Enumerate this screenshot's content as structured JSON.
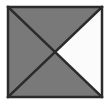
{
  "figure": {
    "name": "square-with-diagonals",
    "canvas": {
      "width": 110,
      "height": 104,
      "background_color": "#ffffff"
    },
    "square": {
      "left": 8,
      "top": 7,
      "right": 102,
      "bottom": 97,
      "stroke_color": "#2b2b2b",
      "stroke_width": 2.5
    },
    "center": {
      "x": 55,
      "y": 52
    },
    "colors": {
      "gray_fill": "#797979",
      "white_fill": "#fbfbfb",
      "line_color": "#2b2b2b",
      "background": "#ffffff"
    },
    "triangles": [
      {
        "name": "top-triangle",
        "position": "top",
        "fill": "#797979",
        "points": "8,7 102,7 55,52"
      },
      {
        "name": "left-triangle",
        "position": "left",
        "fill": "#797979",
        "points": "8,7 55,52 8,97"
      },
      {
        "name": "bottom-triangle",
        "position": "bottom",
        "fill": "#797979",
        "points": "8,97 55,52 102,97"
      },
      {
        "name": "right-triangle",
        "position": "right",
        "fill": "#fbfbfb",
        "points": "102,7 102,97 55,52"
      }
    ],
    "diagonals": [
      {
        "name": "diagonal-top-left-to-bottom-right",
        "x1": 8,
        "y1": 7,
        "x2": 102,
        "y2": 97,
        "stroke": "#2b2b2b",
        "stroke_width": 2.5
      },
      {
        "name": "diagonal-top-right-to-bottom-left",
        "x1": 102,
        "y1": 7,
        "x2": 8,
        "y2": 97,
        "stroke": "#2b2b2b",
        "stroke_width": 2.5
      }
    ]
  }
}
